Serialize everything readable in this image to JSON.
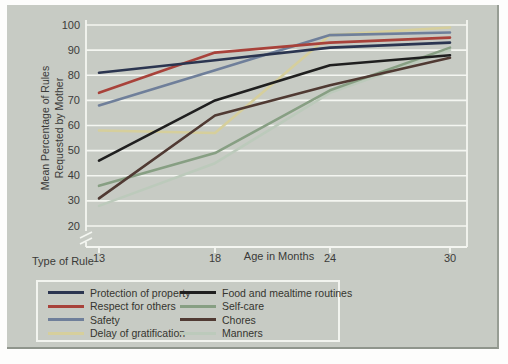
{
  "figure": {
    "y_axis_title_line1": "Mean Percentage of Rules",
    "y_axis_title_line2": "Requested by Mother",
    "x_axis_title": "Age in Months",
    "legend_title": "Type of Rule",
    "panel_background": "#c7cbc4",
    "grid_color": "#f4f6f1",
    "text_color": "#3a3a38"
  },
  "chart_data": {
    "type": "line",
    "x": [
      13,
      18,
      24,
      30
    ],
    "xlabel": "Age in Months",
    "ylabel": "Mean Percentage of Rules Requested by Mother",
    "ylim": [
      20,
      100
    ],
    "yticks": [
      100,
      90,
      80,
      70,
      60,
      50,
      40,
      30,
      20
    ],
    "grid": true,
    "axis_break": true,
    "legend_title": "Type of Rule",
    "legend_position": "bottom",
    "series": [
      {
        "name": "Protection of property",
        "color": "#2b3550",
        "values": [
          81,
          86,
          91,
          93
        ]
      },
      {
        "name": "Respect for others",
        "color": "#a8423a",
        "values": [
          73,
          89,
          93,
          95
        ]
      },
      {
        "name": "Safety",
        "color": "#6f7f9a",
        "values": [
          68,
          82,
          96,
          97
        ]
      },
      {
        "name": "Delay of gratification",
        "color": "#d6cf9c",
        "values": [
          58,
          57,
          96,
          99
        ]
      },
      {
        "name": "Food and mealtime routines",
        "color": "#1f1f1f",
        "values": [
          46,
          70,
          84,
          88
        ]
      },
      {
        "name": "Self-care",
        "color": "#879f83",
        "values": [
          36,
          49,
          74,
          91
        ]
      },
      {
        "name": "Chores",
        "color": "#503a33",
        "values": [
          31,
          64,
          76,
          87
        ]
      },
      {
        "name": "Manners",
        "color": "#bccabb",
        "values": [
          28,
          45,
          73,
          90
        ]
      }
    ]
  },
  "legend": {
    "column1_series": [
      0,
      1,
      2,
      3
    ],
    "column2_series": [
      4,
      5,
      6,
      7
    ]
  }
}
